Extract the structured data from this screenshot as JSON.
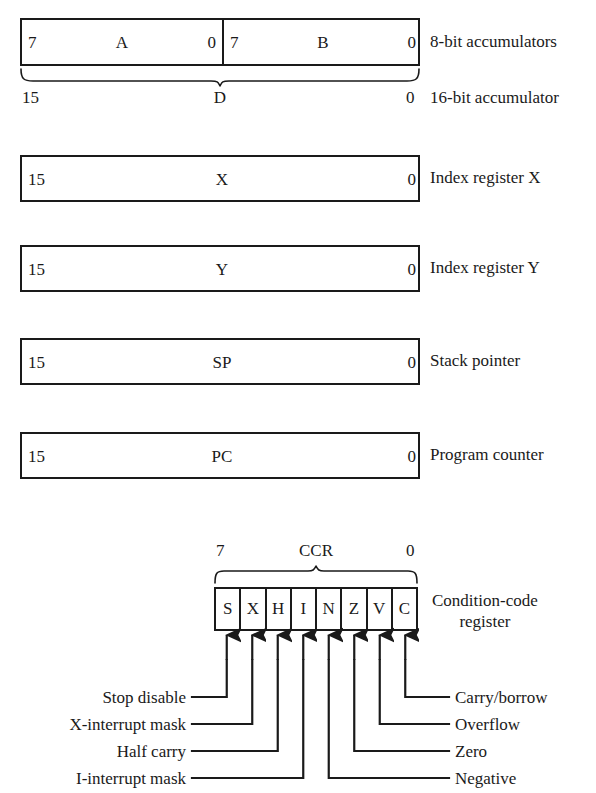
{
  "registers": [
    {
      "id": "accumulators",
      "kind": "split",
      "left": {
        "msb": "7",
        "name": "A",
        "lsb": "0"
      },
      "right": {
        "msb": "7",
        "name": "B",
        "lsb": "0"
      },
      "description": "8-bit accumulators"
    },
    {
      "id": "d-accumulator",
      "kind": "brace",
      "msb": "15",
      "name": "D",
      "lsb": "0",
      "description": "16-bit accumulator"
    },
    {
      "id": "index-x",
      "kind": "single",
      "msb": "15",
      "name": "X",
      "lsb": "0",
      "description": "Index register X"
    },
    {
      "id": "index-y",
      "kind": "single",
      "msb": "15",
      "name": "Y",
      "lsb": "0",
      "description": "Index register Y"
    },
    {
      "id": "stack-pointer",
      "kind": "single",
      "msb": "15",
      "name": "SP",
      "lsb": "0",
      "description": "Stack pointer"
    },
    {
      "id": "program-counter",
      "kind": "single",
      "msb": "15",
      "name": "PC",
      "lsb": "0",
      "description": "Program counter"
    }
  ],
  "ccr": {
    "msb": "7",
    "name": "CCR",
    "lsb": "0",
    "description_line1": "Condition-code",
    "description_line2": "register",
    "bits": [
      {
        "symbol": "S",
        "meaning": "Stop disable",
        "side": "left"
      },
      {
        "symbol": "X",
        "meaning": "X-interrupt mask",
        "side": "left"
      },
      {
        "symbol": "H",
        "meaning": "Half carry",
        "side": "left"
      },
      {
        "symbol": "I",
        "meaning": "I-interrupt mask",
        "side": "left"
      },
      {
        "symbol": "N",
        "meaning": "Negative",
        "side": "right"
      },
      {
        "symbol": "Z",
        "meaning": "Zero",
        "side": "right"
      },
      {
        "symbol": "V",
        "meaning": "Overflow",
        "side": "right"
      },
      {
        "symbol": "C",
        "meaning": "Carry/borrow",
        "side": "right"
      }
    ]
  },
  "colors": {
    "ink": "#1a1a1a",
    "paper": "#ffffff"
  }
}
